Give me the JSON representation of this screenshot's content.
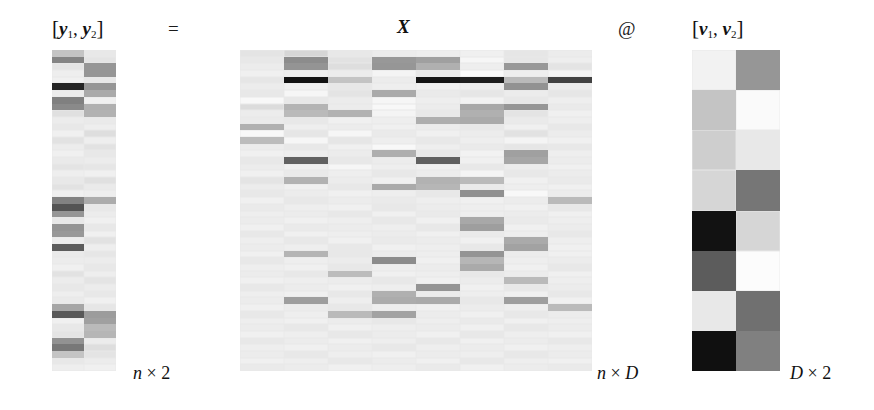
{
  "figure": {
    "equation_labels": {
      "lhs": "[y₁, y₂]",
      "equals": "=",
      "matrix_x": "X",
      "matmul": "@",
      "rhs": "[v₁, v₂]"
    },
    "dimension_labels": {
      "y": "n × 2",
      "x": "n × D",
      "v": "D × 2"
    },
    "parts": {
      "y_bracket_open": "[",
      "y_sym": "y",
      "y_sub1": "1",
      "y_comma": ",",
      "y_sub2": "2",
      "y_bracket_close": "]",
      "v_bracket_open": "[",
      "v_sym": "v",
      "v_sub1": "1",
      "v_comma": ",",
      "v_sub2": "2",
      "v_bracket_close": "]",
      "x_sym": "X",
      "at_sym": "@",
      "equals_sym": "=",
      "n_sym": "n",
      "D_sym": "D",
      "times_sym": "×",
      "two_sym": "2"
    },
    "colors": {
      "background": "#ffffff",
      "text": "#111111",
      "grid_line": "#e8e8e8",
      "colormap_low": "#000000",
      "colormap_high": "#ffffff"
    }
  },
  "chart_data": {
    "type": "heatmap",
    "title": "",
    "xlabel": "",
    "ylabel": "",
    "colormap": "gray",
    "vmin": 0,
    "vmax": 255,
    "legend": "none",
    "grid": true,
    "panels": [
      {
        "name": "Y",
        "label": "[y₁, y₂]",
        "shape_label": "n × 2",
        "rows": 48,
        "cols": 2,
        "values": [
          [
            196,
            232
          ],
          [
            132,
            228
          ],
          [
            228,
            150
          ],
          [
            238,
            150
          ],
          [
            240,
            232
          ],
          [
            36,
            150
          ],
          [
            236,
            170
          ],
          [
            128,
            240
          ],
          [
            138,
            176
          ],
          [
            224,
            178
          ],
          [
            236,
            234
          ],
          [
            232,
            238
          ],
          [
            240,
            222
          ],
          [
            226,
            238
          ],
          [
            236,
            226
          ],
          [
            240,
            232
          ],
          [
            234,
            236
          ],
          [
            228,
            230
          ],
          [
            238,
            240
          ],
          [
            232,
            224
          ],
          [
            226,
            234
          ],
          [
            240,
            238
          ],
          [
            130,
            172
          ],
          [
            84,
            232
          ],
          [
            150,
            236
          ],
          [
            232,
            240
          ],
          [
            148,
            232
          ],
          [
            152,
            240
          ],
          [
            236,
            226
          ],
          [
            92,
            238
          ],
          [
            234,
            230
          ],
          [
            236,
            236
          ],
          [
            240,
            232
          ],
          [
            226,
            238
          ],
          [
            236,
            228
          ],
          [
            232,
            236
          ],
          [
            238,
            232
          ],
          [
            234,
            240
          ],
          [
            166,
            230
          ],
          [
            88,
            156
          ],
          [
            240,
            160
          ],
          [
            232,
            186
          ],
          [
            228,
            182
          ],
          [
            146,
            236
          ],
          [
            120,
            222
          ],
          [
            196,
            228
          ],
          [
            232,
            236
          ],
          [
            238,
            240
          ]
        ]
      },
      {
        "name": "X",
        "label": "X",
        "shape_label": "n × D",
        "rows": 48,
        "cols": 8,
        "values": [
          [
            228,
            214,
            232,
            236,
            238,
            240,
            230,
            236
          ],
          [
            232,
            140,
            226,
            152,
            160,
            246,
            230,
            238
          ],
          [
            236,
            148,
            222,
            150,
            176,
            238,
            152,
            228
          ],
          [
            240,
            238,
            236,
            244,
            232,
            250,
            238,
            244
          ],
          [
            230,
            18,
            196,
            236,
            20,
            30,
            186,
            66
          ],
          [
            236,
            240,
            232,
            238,
            240,
            238,
            146,
            236
          ],
          [
            232,
            246,
            228,
            170,
            234,
            230,
            236,
            230
          ],
          [
            248,
            232,
            236,
            246,
            238,
            242,
            232,
            238
          ],
          [
            220,
            180,
            236,
            248,
            236,
            168,
            150,
            234
          ],
          [
            236,
            186,
            178,
            244,
            232,
            176,
            228,
            240
          ],
          [
            234,
            232,
            240,
            238,
            174,
            170,
            234,
            238
          ],
          [
            176,
            238,
            236,
            240,
            236,
            232,
            240,
            232
          ],
          [
            248,
            230,
            246,
            234,
            240,
            236,
            226,
            236
          ],
          [
            188,
            246,
            230,
            238,
            232,
            238,
            244,
            240
          ],
          [
            236,
            232,
            240,
            248,
            238,
            234,
            230,
            232
          ],
          [
            240,
            238,
            236,
            174,
            232,
            242,
            160,
            238
          ],
          [
            232,
            98,
            232,
            236,
            96,
            240,
            166,
            236
          ],
          [
            236,
            240,
            246,
            238,
            240,
            232,
            236,
            240
          ],
          [
            240,
            234,
            238,
            232,
            236,
            244,
            232,
            236
          ],
          [
            228,
            178,
            236,
            240,
            178,
            186,
            240,
            234
          ],
          [
            236,
            240,
            232,
            170,
            182,
            234,
            238,
            240
          ],
          [
            232,
            236,
            240,
            238,
            232,
            144,
            248,
            236
          ],
          [
            240,
            232,
            236,
            234,
            238,
            240,
            236,
            186
          ],
          [
            234,
            238,
            240,
            232,
            236,
            238,
            240,
            232
          ],
          [
            238,
            236,
            232,
            240,
            234,
            238,
            236,
            240
          ],
          [
            236,
            240,
            238,
            232,
            240,
            168,
            234,
            238
          ],
          [
            240,
            234,
            236,
            238,
            232,
            158,
            240,
            236
          ],
          [
            232,
            240,
            238,
            236,
            240,
            234,
            238,
            232
          ],
          [
            238,
            232,
            240,
            234,
            236,
            240,
            170,
            238
          ],
          [
            236,
            238,
            232,
            240,
            238,
            232,
            162,
            240
          ],
          [
            240,
            180,
            232,
            236,
            238,
            148,
            236,
            240
          ],
          [
            232,
            238,
            236,
            140,
            240,
            182,
            238,
            236
          ],
          [
            238,
            240,
            232,
            238,
            236,
            170,
            240,
            232
          ],
          [
            236,
            232,
            188,
            240,
            238,
            232,
            236,
            240
          ],
          [
            240,
            238,
            236,
            232,
            240,
            236,
            186,
            238
          ],
          [
            232,
            236,
            240,
            238,
            148,
            240,
            232,
            236
          ],
          [
            238,
            240,
            232,
            176,
            236,
            238,
            240,
            232
          ],
          [
            236,
            158,
            238,
            172,
            170,
            232,
            158,
            240
          ],
          [
            240,
            236,
            232,
            238,
            240,
            236,
            238,
            186
          ],
          [
            232,
            238,
            186,
            162,
            236,
            240,
            232,
            236
          ],
          [
            238,
            240,
            236,
            232,
            238,
            234,
            240,
            238
          ],
          [
            236,
            232,
            240,
            238,
            236,
            240,
            232,
            236
          ],
          [
            240,
            238,
            232,
            236,
            240,
            232,
            238,
            240
          ],
          [
            232,
            236,
            240,
            238,
            232,
            240,
            236,
            232
          ],
          [
            238,
            240,
            236,
            232,
            238,
            236,
            240,
            238
          ],
          [
            236,
            232,
            238,
            240,
            236,
            238,
            232,
            236
          ],
          [
            240,
            238,
            232,
            236,
            240,
            232,
            238,
            240
          ],
          [
            234,
            236,
            240,
            238,
            234,
            240,
            236,
            234
          ]
        ]
      },
      {
        "name": "V",
        "label": "[v₁, v₂]",
        "shape_label": "D × 2",
        "rows": 8,
        "cols": 2,
        "values": [
          [
            242,
            150
          ],
          [
            196,
            250
          ],
          [
            206,
            232
          ],
          [
            214,
            118
          ],
          [
            18,
            214
          ],
          [
            92,
            252
          ],
          [
            232,
            112
          ],
          [
            16,
            128
          ]
        ]
      }
    ]
  }
}
